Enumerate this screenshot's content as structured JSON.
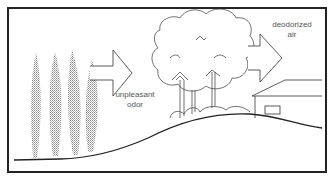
{
  "diagram": {
    "labels": {
      "unpleasant_odor_line1": "unpleasant",
      "unpleasant_odor_line2": "odor",
      "deodorized_air_line1": "deodorized",
      "deodorized_air_line2": "air"
    },
    "colors": {
      "line": "#222222",
      "smoke": "#9a9a9a",
      "label": "#555555",
      "background": "#ffffff"
    },
    "elements": [
      "odor-plumes",
      "odor-arrow",
      "tree-buffer",
      "deodorized-arrow",
      "house",
      "hill-ground"
    ]
  }
}
